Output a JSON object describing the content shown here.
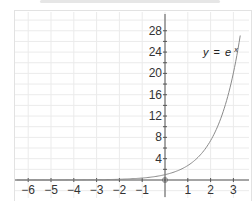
{
  "chart_data": {
    "type": "line",
    "title": "",
    "xlabel": "",
    "ylabel": "",
    "function": "y = e^x",
    "annotation": "y = e^x",
    "x": [
      -6,
      -5,
      -4,
      -3,
      -2,
      -1,
      0,
      0.5,
      1,
      1.5,
      2,
      2.5,
      3,
      3.3
    ],
    "series": [
      {
        "name": "y = e^x",
        "values": [
          0.0025,
          0.0067,
          0.018,
          0.05,
          0.135,
          0.368,
          1,
          1.65,
          2.72,
          4.48,
          7.39,
          12.18,
          20.09,
          27.1
        ]
      }
    ],
    "xticks": [
      "-6",
      "-5",
      "-4",
      "-3",
      "-2",
      "-1",
      "1",
      "2",
      "3"
    ],
    "yticks": [
      "4",
      "8",
      "12",
      "16",
      "20",
      "24",
      "28"
    ],
    "xlim": [
      -6.5,
      3.5
    ],
    "ylim": [
      -3,
      30
    ],
    "grid": true,
    "legend": "none",
    "origin_marker": "open-circle",
    "colors": {
      "curve": "#8a8a8a",
      "axis": "#555555",
      "grid": "#ebebeb"
    }
  },
  "labels": {
    "curve_label_y": "y",
    "curve_label_eq": "=",
    "curve_label_base": "e",
    "curve_label_exp": "x"
  }
}
